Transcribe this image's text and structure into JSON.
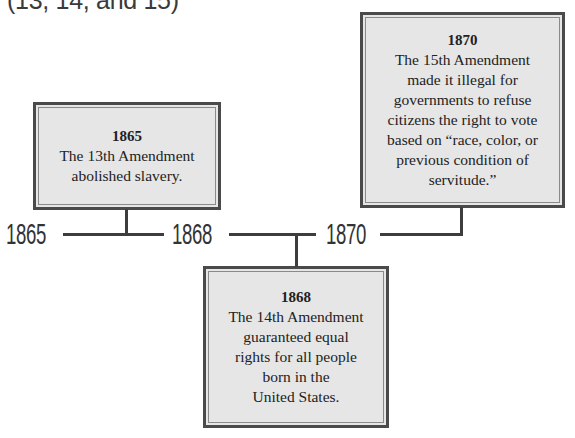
{
  "heading": {
    "text": "(13, 14, and 15)"
  },
  "timeline": {
    "labels": [
      "1865",
      "1868",
      "1870"
    ],
    "events": [
      {
        "year": "1865",
        "lines": [
          "The 13th Amendment",
          "abolished slavery."
        ]
      },
      {
        "year": "1868",
        "lines": [
          "The 14th Amendment",
          "guaranteed equal",
          "rights for all people",
          "born in the",
          "United States."
        ]
      },
      {
        "year": "1870",
        "lines": [
          "The 15th Amendment",
          "made it illegal for",
          "governments to refuse",
          "citizens the right to vote",
          "based on “race, color, or",
          "previous condition of",
          "servitude.”"
        ]
      }
    ]
  },
  "colors": {
    "box_fill": "#e6e6e6",
    "box_border": "#4a4a4a",
    "line": "#3d3d3d",
    "text": "#222222"
  }
}
